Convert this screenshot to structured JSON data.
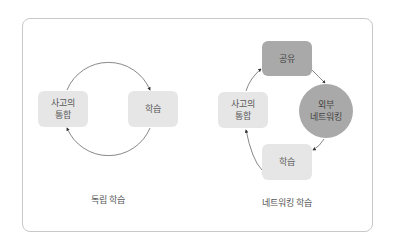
{
  "diagrams": [
    {
      "caption": "독립 학습",
      "nodes": [
        {
          "label": "사고의\n통합",
          "shape": "rounded-rect",
          "fill": "#e6e6e6"
        },
        {
          "label": "학습",
          "shape": "rounded-rect",
          "fill": "#e6e6e6"
        }
      ],
      "edges": [
        {
          "from": "사고의 통합",
          "to": "학습",
          "path": "top arc"
        },
        {
          "from": "학습",
          "to": "사고의 통합",
          "path": "bottom arc"
        }
      ]
    },
    {
      "caption": "네트워킹 학습",
      "nodes": [
        {
          "label": "공유",
          "shape": "rounded-rect",
          "fill": "#a9a9a9"
        },
        {
          "label": "외부\n네트워킹",
          "shape": "circle",
          "fill": "#a9a9a9"
        },
        {
          "label": "학습",
          "shape": "rounded-rect",
          "fill": "#e6e6e6"
        },
        {
          "label": "사고의\n통합",
          "shape": "rounded-rect",
          "fill": "#e6e6e6"
        }
      ],
      "edges": [
        {
          "from": "공유",
          "to": "외부 네트워킹"
        },
        {
          "from": "외부 네트워킹",
          "to": "학습"
        },
        {
          "from": "학습",
          "to": "사고의 통합"
        },
        {
          "from": "사고의 통합",
          "to": "공유"
        }
      ]
    }
  ],
  "colors": {
    "frame_border": "#c8c8c8",
    "light_node": "#e6e6e6",
    "dark_node": "#a9a9a9",
    "arrow": "#333333"
  }
}
